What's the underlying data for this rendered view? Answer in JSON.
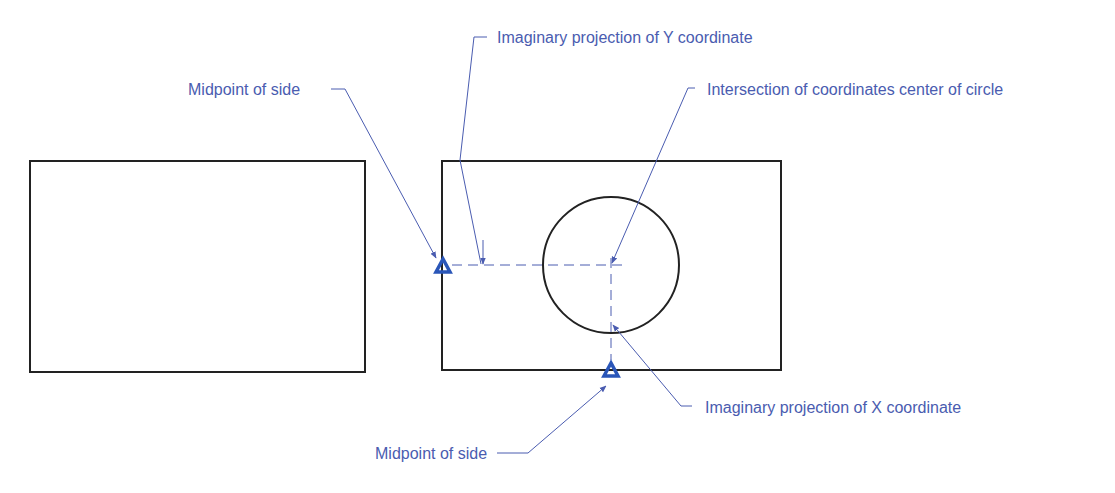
{
  "diagram": {
    "colors": {
      "outline": "#222222",
      "annotation": "#4a5cb0",
      "marker": "#2a56b8"
    },
    "shapes": {
      "left_rectangle": {
        "x": 30,
        "y": 161,
        "w": 335,
        "h": 211
      },
      "right_rectangle": {
        "x": 442,
        "y": 161,
        "w": 339,
        "h": 209
      },
      "circle": {
        "cx": 611,
        "cy": 265,
        "r": 68
      }
    },
    "labels": {
      "midpoint_left": "Midpoint of side",
      "y_projection": "Imaginary projection of Y coordinate",
      "intersection": "Intersection of coordinates center of circle",
      "x_projection": "Imaginary projection of X coordinate",
      "midpoint_bottom": "Midpoint of side"
    },
    "markers": [
      {
        "name": "left-side-midpoint",
        "x": 443,
        "y": 265
      },
      {
        "name": "bottom-side-midpoint",
        "x": 611,
        "y": 370
      }
    ]
  }
}
